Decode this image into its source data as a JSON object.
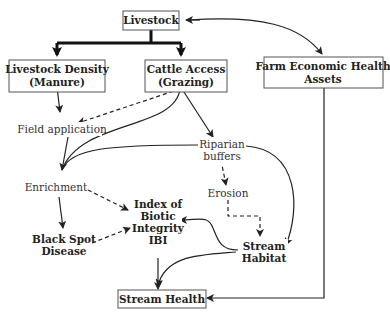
{
  "diagram": {
    "nodes": {
      "livestock": {
        "label": "Livestock"
      },
      "livestock_density": {
        "line1": "Livestock Density",
        "line2": "(Manure)"
      },
      "cattle_access": {
        "line1": "Cattle Access",
        "line2": "(Grazing)"
      },
      "farm_economic": {
        "line1": "Farm Economic Health",
        "line2": "Assets"
      },
      "field_application": {
        "label": "Field application"
      },
      "riparian_buffers": {
        "line1": "Riparian",
        "line2": "buffers"
      },
      "enrichment": {
        "label": "Enrichment"
      },
      "erosion": {
        "label": "Erosion"
      },
      "ibi": {
        "line1": "Index of",
        "line2": "Biotic",
        "line3": "Integrity",
        "line4": "IBI"
      },
      "black_spot": {
        "line1": "Black Spot",
        "line2": "Disease"
      },
      "stream_habitat": {
        "line1": "Stream",
        "line2": "Habitat"
      },
      "stream_health": {
        "label": "Stream Health"
      }
    },
    "edges": [
      {
        "from": "Livestock",
        "to": "Livestock Density (Manure)",
        "style": "thick"
      },
      {
        "from": "Livestock",
        "to": "Cattle Access (Grazing)",
        "style": "thick"
      },
      {
        "from": "Livestock",
        "to": "Farm Economic Health Assets",
        "style": "solid-bidirectional"
      },
      {
        "from": "Livestock Density (Manure)",
        "to": "Field application",
        "style": "solid"
      },
      {
        "from": "Cattle Access (Grazing)",
        "to": "Field application",
        "style": "dashed"
      },
      {
        "from": "Cattle Access (Grazing)",
        "to": "Enrichment",
        "style": "solid"
      },
      {
        "from": "Cattle Access (Grazing)",
        "to": "Riparian buffers",
        "style": "solid"
      },
      {
        "from": "Field application",
        "to": "Enrichment",
        "style": "solid"
      },
      {
        "from": "Riparian buffers",
        "to": "Enrichment",
        "style": "solid"
      },
      {
        "from": "Riparian buffers",
        "to": "Erosion",
        "style": "dashed"
      },
      {
        "from": "Riparian buffers",
        "to": "Stream Habitat",
        "style": "solid"
      },
      {
        "from": "Erosion",
        "to": "Stream Habitat",
        "style": "dashed"
      },
      {
        "from": "Enrichment",
        "to": "Index of Biotic Integrity IBI",
        "style": "dashed"
      },
      {
        "from": "Enrichment",
        "to": "Black Spot Disease",
        "style": "solid"
      },
      {
        "from": "Black Spot Disease",
        "to": "Index of Biotic Integrity IBI",
        "style": "dashed"
      },
      {
        "from": "Stream Habitat",
        "to": "Index of Biotic Integrity IBI",
        "style": "solid"
      },
      {
        "from": "Stream Habitat",
        "to": "Stream Health",
        "style": "solid"
      },
      {
        "from": "Index of Biotic Integrity IBI",
        "to": "Stream Health",
        "style": "solid"
      },
      {
        "from": "Farm Economic Health Assets",
        "to": "Stream Health",
        "style": "solid"
      }
    ]
  }
}
